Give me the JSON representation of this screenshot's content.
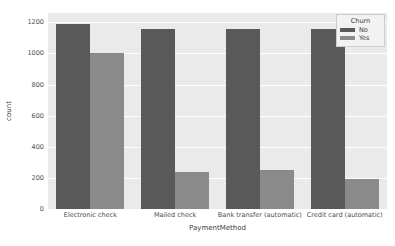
{
  "chart_data": {
    "type": "bar",
    "title": "",
    "subtitle": "",
    "xlabel": "PaymentMethod",
    "ylabel": "count",
    "categories": [
      "Electronic check",
      "Mailed check",
      "Bank transfer (automatic)",
      "Credit card (automatic)"
    ],
    "series": [
      {
        "name": "No",
        "values": [
          1190,
          1160,
          1160,
          1160
        ],
        "color": "#595959"
      },
      {
        "name": "Yes",
        "values": [
          1000,
          235,
          250,
          190
        ],
        "color": "#8a8a8a"
      }
    ],
    "ylim": [
      0,
      1260
    ],
    "yticks": [
      0,
      200,
      400,
      600,
      800,
      1000,
      1200
    ],
    "ytick_labels": [
      "0",
      "200",
      "400",
      "600",
      "800",
      "1000",
      "1200"
    ],
    "grid": true,
    "grid_axis": "y",
    "grid_color": "#ffffff",
    "plot_background": "#eaeaea",
    "figure_background": "#ffffff",
    "legend": {
      "title": "Churn",
      "position": "upper right",
      "entries": [
        "No",
        "Yes"
      ]
    }
  }
}
